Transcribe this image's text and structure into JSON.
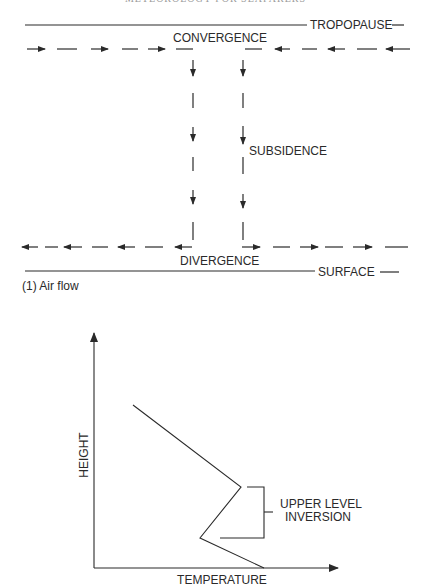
{
  "header": {
    "running_title": "METEOROLOGY FOR SEAFARERS"
  },
  "figure1": {
    "caption": "(1) Air flow",
    "labels": {
      "top_boundary": "TROPOPAUSE",
      "bottom_boundary": "SURFACE",
      "convergence": "CONVERGENCE",
      "divergence": "DIVERGENCE",
      "subsidence": "SUBSIDENCE"
    }
  },
  "figure2": {
    "x_axis_label": "TEMPERATURE",
    "y_axis_label": "HEIGHT",
    "annotation_line1": "UPPER LEVEL",
    "annotation_line2": "INVERSION"
  },
  "colors": {
    "ink": "#2a2a2a",
    "paper": "#ffffff"
  }
}
